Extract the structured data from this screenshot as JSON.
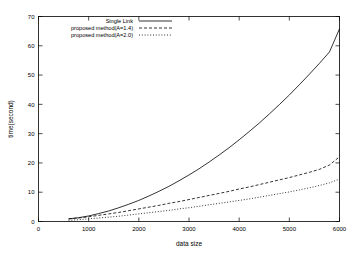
{
  "chart_data": {
    "type": "line",
    "title": "",
    "xlabel": "data size",
    "ylabel": "time(second)",
    "xlim": [
      0,
      6000
    ],
    "ylim": [
      0,
      70
    ],
    "grid": false,
    "legend_position": "top-center-inside",
    "xticks": [
      "0",
      "1000",
      "2000",
      "3000",
      "4000",
      "5000",
      "6000"
    ],
    "xtick_values": [
      0,
      1000,
      2000,
      3000,
      4000,
      5000,
      6000
    ],
    "yticks": [
      "0",
      "10",
      "20",
      "30",
      "40",
      "50",
      "60",
      "70"
    ],
    "ytick_values": [
      0,
      10,
      20,
      30,
      40,
      50,
      60,
      70
    ],
    "x": [
      600,
      800,
      1000,
      1200,
      1400,
      1600,
      1800,
      2000,
      2200,
      2400,
      2600,
      2800,
      3000,
      3200,
      3400,
      3600,
      3800,
      4000,
      4200,
      4400,
      4600,
      4800,
      5000,
      5200,
      5400,
      5600,
      5800,
      6000
    ],
    "series": [
      {
        "name": "Single Link",
        "dash": "solid",
        "values": [
          0.9,
          1.3,
          1.9,
          2.7,
          3.6,
          4.7,
          5.9,
          7.2,
          8.7,
          10.3,
          12.0,
          13.9,
          15.9,
          18.0,
          20.3,
          22.7,
          25.2,
          27.9,
          30.7,
          33.6,
          36.7,
          39.9,
          43.2,
          46.7,
          50.3,
          54.0,
          57.9,
          65.8
        ]
      },
      {
        "name": "proposed method(A=1.4)",
        "dash": "dashed",
        "values": [
          0.9,
          1.2,
          1.6,
          2.1,
          2.6,
          3.1,
          3.7,
          4.3,
          4.9,
          5.5,
          6.2,
          6.8,
          7.5,
          8.2,
          8.9,
          9.6,
          10.3,
          11.1,
          11.8,
          12.6,
          13.4,
          14.2,
          15.0,
          15.9,
          16.8,
          17.8,
          19.3,
          22.1
        ]
      },
      {
        "name": "proposed method(A=2.0)",
        "dash": "dotted",
        "values": [
          0.4,
          0.6,
          0.9,
          1.2,
          1.5,
          1.8,
          2.2,
          2.6,
          3.0,
          3.4,
          3.8,
          4.3,
          4.7,
          5.2,
          5.7,
          6.2,
          6.7,
          7.2,
          7.7,
          8.3,
          8.9,
          9.5,
          10.1,
          10.8,
          11.5,
          12.3,
          13.2,
          14.5
        ]
      }
    ],
    "colors": {
      "line": "#000000",
      "axis": "#000000",
      "background": "#ffffff"
    }
  }
}
